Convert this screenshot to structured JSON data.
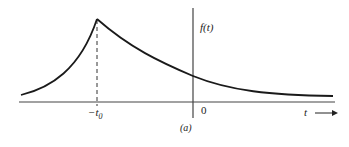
{
  "figure": {
    "function_label": "f(t)",
    "x_axis_label": "t",
    "origin_label": "0",
    "peak_label_prefix": "−t",
    "peak_label_sub": "0",
    "caption": "(a)"
  },
  "curve": {
    "description": "Two-sided exponential peaking at t = -t0, decaying to both sides",
    "peak_x": "-t0",
    "colors": {
      "curve": "#1a1a1a",
      "axis": "#444444",
      "dashed": "#333333"
    }
  }
}
